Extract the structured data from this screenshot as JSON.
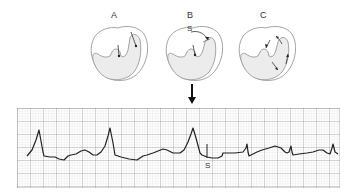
{
  "panels": [
    {
      "label": "A",
      "annotation": ""
    },
    {
      "label": "B",
      "annotation": "S"
    },
    {
      "label": "C",
      "annotation": ""
    }
  ],
  "ecg": {
    "s_marker_label": "S",
    "colors": {
      "trace": "#222222",
      "grid_major": "#8a8a8a",
      "grid_minor": "#c8c8c8",
      "heart_fill": "#ececec",
      "heart_stroke": "#9a9a9a"
    }
  }
}
